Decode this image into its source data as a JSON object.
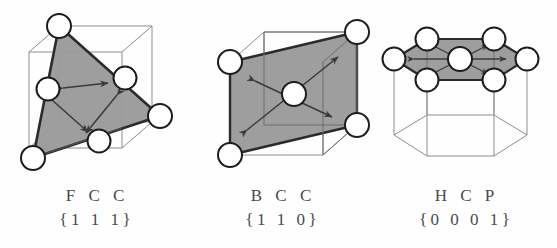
{
  "figure": {
    "background_color": "#fefefe",
    "plane_fill_color": "#9a9a9a",
    "plane_edge_color": "#2b2b2b",
    "cell_edge_color": "#8d8d8d",
    "atom_fill_color": "#ffffff",
    "atom_stroke_color": "#1c1c1c",
    "arrow_color": "#3a3a3a",
    "caption_color": "#4a4a4a"
  },
  "panels": [
    {
      "id": "fcc",
      "structure_label": "F C C",
      "plane_label": "{1 1 1}",
      "cell_shape": "cube",
      "slip_plane": "111",
      "atom_count": 6,
      "slip_direction_count": 3
    },
    {
      "id": "bcc",
      "structure_label": "B C C",
      "plane_label": "{1 1 0}",
      "cell_shape": "cube",
      "slip_plane": "110",
      "atom_count": 5,
      "slip_direction_count": 2
    },
    {
      "id": "hcp",
      "structure_label": "H C P",
      "plane_label": "{0 0 0 1}",
      "cell_shape": "hexagonal-prism",
      "slip_plane": "0001",
      "atom_count": 7,
      "slip_direction_count": 3
    }
  ]
}
